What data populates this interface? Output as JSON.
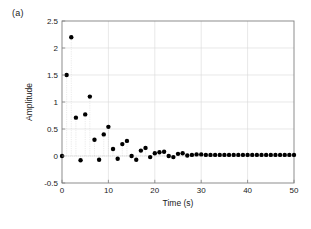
{
  "figure": {
    "panel_label": "(a)",
    "background_color": "#ffffff",
    "axes_color": "#808080",
    "grid_color": "#d9d9d9",
    "marker_color": "#000000",
    "stem_color": "#cccccc"
  },
  "chart_data": {
    "type": "scatter",
    "title": "",
    "xlabel": "Time (s)",
    "ylabel": "Amplitude",
    "xlim": [
      0,
      50
    ],
    "ylim": [
      -0.5,
      2.5
    ],
    "xticks": [
      0,
      10,
      20,
      30,
      40,
      50
    ],
    "yticks": [
      -0.5,
      0,
      0.5,
      1,
      1.5,
      2,
      2.5
    ],
    "xtick_labels": [
      "0",
      "10",
      "20",
      "30",
      "40",
      "50"
    ],
    "ytick_labels": [
      "-0.5",
      "0",
      "0.5",
      "1",
      "1.5",
      "2",
      "2.5"
    ],
    "grid": true,
    "legend": null,
    "marker": "dot",
    "marker_size": 2.2,
    "stems": true,
    "stem_baseline": 0,
    "series": [
      {
        "name": "Impulse response",
        "x": [
          0,
          1,
          2,
          3,
          4,
          5,
          6,
          7,
          8,
          9,
          10,
          11,
          12,
          13,
          14,
          15,
          16,
          17,
          18,
          19,
          20,
          21,
          22,
          23,
          24,
          25,
          26,
          27,
          28,
          29,
          30,
          31,
          32,
          33,
          34,
          35,
          36,
          37,
          38,
          39,
          40,
          41,
          42,
          43,
          44,
          45,
          46,
          47,
          48,
          49,
          50
        ],
        "y": [
          0.0,
          1.5,
          2.2,
          0.71,
          -0.08,
          0.77,
          1.1,
          0.3,
          -0.07,
          0.4,
          0.54,
          0.13,
          -0.05,
          0.22,
          0.28,
          0.0,
          -0.07,
          0.1,
          0.15,
          -0.02,
          0.05,
          0.07,
          0.08,
          0.0,
          -0.02,
          0.04,
          0.05,
          0.01,
          0.02,
          0.03,
          0.03,
          0.02,
          0.02,
          0.02,
          0.02,
          0.02,
          0.02,
          0.02,
          0.02,
          0.02,
          0.02,
          0.02,
          0.02,
          0.02,
          0.02,
          0.02,
          0.02,
          0.02,
          0.02,
          0.02,
          0.02
        ]
      }
    ]
  }
}
